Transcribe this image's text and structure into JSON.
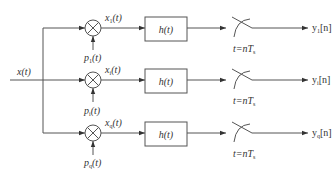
{
  "diagram": {
    "type": "block-diagram",
    "input": {
      "label": "x(t)"
    },
    "branches": [
      {
        "multiplier_signal": {
          "base": "p",
          "sub": "1",
          "suffix": "(t)"
        },
        "intermediate_signal": {
          "base": "x",
          "sub": "1",
          "suffix": "(t)"
        },
        "filter_label": "h(t)",
        "sampler_label": {
          "prefix": "t=nT",
          "sub": "s"
        },
        "output": {
          "base": "y",
          "sub": "1",
          "suffix": "[n]"
        }
      },
      {
        "multiplier_signal": {
          "base": "p",
          "sub": "i",
          "suffix": "(t)"
        },
        "intermediate_signal": {
          "base": "x",
          "sub": "i",
          "suffix": "(t)"
        },
        "filter_label": "h(t)",
        "sampler_label": {
          "prefix": "t=nT",
          "sub": "s"
        },
        "output": {
          "base": "y",
          "sub": "i",
          "suffix": "[n]"
        }
      },
      {
        "multiplier_signal": {
          "base": "p",
          "sub": "q",
          "suffix": "(t)"
        },
        "intermediate_signal": {
          "base": "x",
          "sub": "q",
          "suffix": "(t)"
        },
        "filter_label": "h(t)",
        "sampler_label": {
          "prefix": "t=nT",
          "sub": "s"
        },
        "output": {
          "base": "y",
          "sub": "q",
          "suffix": "[n]"
        }
      }
    ],
    "colors": {
      "line": "#555555",
      "text": "#333333",
      "background": "#ffffff"
    }
  }
}
